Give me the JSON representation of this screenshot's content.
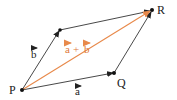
{
  "diagram": {
    "type": "vector-parallelogram",
    "colors": {
      "edge": "#333333",
      "resultant": "#e8894a",
      "resultant_label": "#e07a3a",
      "point": "#111111",
      "background": "#ffffff"
    },
    "points": {
      "P": {
        "label": "P",
        "x": 22,
        "y": 90
      },
      "Q": {
        "label": "Q",
        "x": 114,
        "y": 73
      },
      "R": {
        "label": "R",
        "x": 152,
        "y": 10
      },
      "S": {
        "label": "",
        "x": 60,
        "y": 30
      }
    },
    "vectors": {
      "a": {
        "label": "a",
        "from": "P",
        "to": "Q"
      },
      "b": {
        "label": "b",
        "from": "P",
        "to": "S"
      },
      "a_top": {
        "from": "S",
        "to": "R"
      },
      "b_right": {
        "from": "Q",
        "to": "R"
      },
      "sum": {
        "label": "a + b",
        "from": "P",
        "to": "R"
      }
    },
    "labels": {
      "P": "P",
      "Q": "Q",
      "R": "R",
      "a": "a",
      "b": "b",
      "sum_a": "a",
      "sum_plus": "+",
      "sum_b": "b"
    }
  }
}
